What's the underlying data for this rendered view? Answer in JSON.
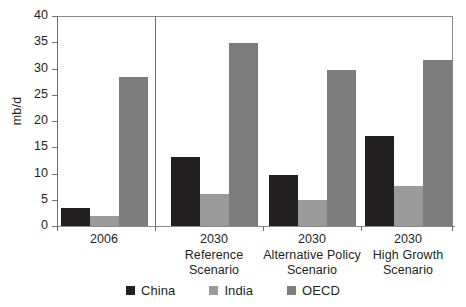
{
  "chart_data": {
    "type": "bar",
    "title": "",
    "subtitle": "",
    "xlabel": "",
    "ylabel": "mb/d",
    "ylim": [
      0,
      40
    ],
    "yticks": [
      0,
      5,
      10,
      15,
      20,
      25,
      30,
      35,
      40
    ],
    "grid": false,
    "legend_position": "bottom",
    "categories": [
      "2006",
      "2030\nReference\nScenario",
      "2030\nAlternative Policy\nScenario",
      "2030\nHigh Growth\nScenario"
    ],
    "category_lines": [
      [
        "2006"
      ],
      [
        "2030",
        "Reference",
        "Scenario"
      ],
      [
        "2030",
        "Alternative Policy",
        "Scenario"
      ],
      [
        "2030",
        "High Growth",
        "Scenario"
      ]
    ],
    "series": [
      {
        "name": "China",
        "color": "#231f20",
        "values": [
          3.5,
          13.1,
          9.7,
          17.1
        ]
      },
      {
        "name": "India",
        "color": "#9a9a9a",
        "values": [
          2.0,
          6.1,
          4.9,
          7.6
        ]
      },
      {
        "name": "OECD",
        "color": "#7d7d7d",
        "values": [
          28.3,
          34.8,
          29.7,
          31.6
        ]
      }
    ],
    "annotations": [
      {
        "type": "vertical-separator",
        "after_category": "2006"
      }
    ]
  },
  "axis": {
    "y_unit_label": "mb/d",
    "tick_labels": [
      "40",
      "35",
      "30",
      "25",
      "20",
      "15",
      "10",
      "5",
      "0"
    ]
  },
  "legend": {
    "items": [
      {
        "label": "China",
        "color": "#231f20"
      },
      {
        "label": "India",
        "color": "#9a9a9a"
      },
      {
        "label": "OECD",
        "color": "#7d7d7d"
      }
    ]
  }
}
